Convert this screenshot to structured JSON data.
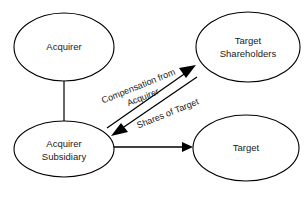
{
  "diagram": {
    "type": "flow-diagram",
    "background_color": "#ffffff",
    "stroke_color": "#000000",
    "text_color": "#1a1a1a",
    "nodes": [
      {
        "id": "acquirer",
        "shape": "ellipse",
        "label_line1": "Acquirer",
        "label_line2": "",
        "cx": 64,
        "cy": 47,
        "rx": 50,
        "ry": 34
      },
      {
        "id": "target-shareholders",
        "shape": "ellipse",
        "label_line1": "Target",
        "label_line2": "Shareholders",
        "cx": 248,
        "cy": 47,
        "rx": 52,
        "ry": 35
      },
      {
        "id": "acquirer-subsidiary",
        "shape": "ellipse",
        "label_line1": "Acquirer",
        "label_line2": "Subsidiary",
        "cx": 64,
        "cy": 149,
        "rx": 50,
        "ry": 28
      },
      {
        "id": "target",
        "shape": "ellipse",
        "label_line1": "Target",
        "label_line2": "",
        "cx": 246,
        "cy": 148,
        "rx": 53,
        "ry": 33
      }
    ],
    "edges": [
      {
        "id": "acquirer-to-subsidiary",
        "from": "acquirer",
        "to": "acquirer-subsidiary",
        "label": "",
        "arrowhead": "none",
        "style": "vertical-line"
      },
      {
        "id": "compensation-edge",
        "from": "acquirer-subsidiary",
        "to": "target-shareholders",
        "label_line1": "Compensation from",
        "label_line2": "Acquirer",
        "arrowhead": "target-shareholders",
        "style": "diagonal-up-right",
        "label_rotation": -22
      },
      {
        "id": "shares-edge",
        "from": "target-shareholders",
        "to": "acquirer-subsidiary",
        "label_line1": "Shares of Target",
        "label_line2": "",
        "arrowhead": "acquirer-subsidiary",
        "style": "diagonal-down-left",
        "label_rotation": -22
      },
      {
        "id": "subsidiary-to-target",
        "from": "acquirer-subsidiary",
        "to": "target",
        "label": "",
        "arrowhead": "target",
        "style": "horizontal-line"
      }
    ]
  }
}
